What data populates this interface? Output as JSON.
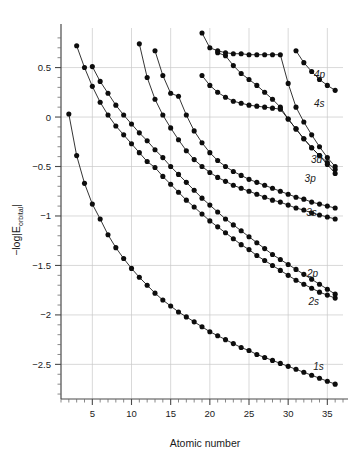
{
  "chart_data": {
    "type": "line",
    "title": "",
    "xlabel": "Atomic number",
    "ylabel": "−log|E₀ᵣᵇᵢₜₐₗ|",
    "ylabel_parts": {
      "prefix": "−log|E",
      "subscript": "orbital",
      "suffix": "|"
    },
    "xlim": [
      1,
      37
    ],
    "ylim": [
      -2.85,
      0.9
    ],
    "xticks": [
      5,
      10,
      15,
      20,
      25,
      30,
      35
    ],
    "xtick_labels": [
      "5",
      "10",
      "15",
      "20",
      "25",
      "30",
      "35"
    ],
    "xminor_step": 1,
    "yticks": [
      0.5,
      0,
      -0.5,
      -1,
      -1.5,
      -2,
      -2.5
    ],
    "ytick_labels": [
      "0.5",
      "0",
      "−0.5",
      "−1",
      "−1.5",
      "−2",
      "−2.5"
    ],
    "yminor_step": 0.1,
    "grid": "both-major",
    "legend_position": "inline-right-of-curve-ends",
    "marker": "filled-circle",
    "series": [
      {
        "name": "1s",
        "label": "1s",
        "label_at": {
          "x": 33.2,
          "y": -2.52
        },
        "x": [
          2,
          3,
          4,
          5,
          6,
          7,
          8,
          9,
          10,
          11,
          12,
          13,
          14,
          15,
          16,
          17,
          18,
          19,
          20,
          21,
          22,
          23,
          24,
          25,
          26,
          27,
          28,
          29,
          30,
          31,
          32,
          33,
          34,
          35,
          36
        ],
        "y": [
          0.03,
          -0.39,
          -0.67,
          -0.88,
          -1.03,
          -1.19,
          -1.32,
          -1.43,
          -1.53,
          -1.62,
          -1.7,
          -1.78,
          -1.85,
          -1.91,
          -1.97,
          -2.02,
          -2.07,
          -2.12,
          -2.17,
          -2.21,
          -2.25,
          -2.29,
          -2.33,
          -2.36,
          -2.4,
          -2.43,
          -2.46,
          -2.49,
          -2.52,
          -2.55,
          -2.58,
          -2.61,
          -2.64,
          -2.67,
          -2.7
        ]
      },
      {
        "name": "2s",
        "label": "2s",
        "label_at": {
          "x": 32.6,
          "y": -1.86
        },
        "x": [
          3,
          4,
          5,
          6,
          7,
          8,
          9,
          10,
          11,
          12,
          13,
          14,
          15,
          16,
          17,
          18,
          19,
          20,
          21,
          22,
          23,
          24,
          25,
          26,
          27,
          28,
          29,
          30,
          31,
          32,
          33,
          34,
          35,
          36
        ],
        "y": [
          0.72,
          0.5,
          0.31,
          0.15,
          0.02,
          -0.09,
          -0.18,
          -0.27,
          -0.36,
          -0.45,
          -0.51,
          -0.6,
          -0.68,
          -0.76,
          -0.84,
          -0.91,
          -0.98,
          -1.05,
          -1.11,
          -1.17,
          -1.23,
          -1.29,
          -1.34,
          -1.4,
          -1.45,
          -1.5,
          -1.55,
          -1.6,
          -1.65,
          -1.69,
          -1.73,
          -1.77,
          -1.8,
          -1.83
        ]
      },
      {
        "name": "2p",
        "label": "2p",
        "label_at": {
          "x": 32.4,
          "y": -1.58
        },
        "x": [
          5,
          6,
          7,
          8,
          9,
          10,
          11,
          12,
          13,
          14,
          15,
          16,
          17,
          18,
          19,
          20,
          21,
          22,
          23,
          24,
          25,
          26,
          27,
          28,
          29,
          30,
          31,
          32,
          33,
          34,
          35,
          36
        ],
        "y": [
          0.51,
          0.36,
          0.24,
          0.12,
          0.02,
          -0.07,
          -0.16,
          -0.24,
          -0.33,
          -0.41,
          -0.5,
          -0.58,
          -0.66,
          -0.74,
          -0.82,
          -0.89,
          -0.96,
          -1.03,
          -1.09,
          -1.15,
          -1.21,
          -1.27,
          -1.33,
          -1.39,
          -1.44,
          -1.49,
          -1.54,
          -1.59,
          -1.64,
          -1.69,
          -1.74,
          -1.79
        ]
      },
      {
        "name": "3s",
        "label": "3s",
        "label_at": {
          "x": 32.3,
          "y": -0.96
        },
        "x": [
          11,
          12,
          13,
          14,
          15,
          16,
          17,
          18,
          19,
          20,
          21,
          22,
          23,
          24,
          25,
          26,
          27,
          28,
          29,
          30,
          31,
          32,
          33,
          34,
          35,
          36
        ],
        "y": [
          0.74,
          0.4,
          0.18,
          0.02,
          -0.11,
          -0.23,
          -0.34,
          -0.43,
          -0.5,
          -0.56,
          -0.61,
          -0.65,
          -0.69,
          -0.72,
          -0.75,
          -0.78,
          -0.81,
          -0.84,
          -0.86,
          -0.89,
          -0.92,
          -0.94,
          -0.97,
          -0.99,
          -1.01,
          -1.03
        ]
      },
      {
        "name": "3p",
        "label": "3p",
        "label_at": {
          "x": 32.1,
          "y": -0.62
        },
        "x": [
          13,
          14,
          15,
          16,
          17,
          18,
          19,
          20,
          21,
          22,
          23,
          24,
          25,
          26,
          27,
          28,
          29,
          30,
          31,
          32,
          33,
          34,
          35,
          36
        ],
        "y": [
          0.67,
          0.42,
          0.24,
          0.21,
          0.02,
          -0.14,
          -0.26,
          -0.36,
          -0.44,
          -0.5,
          -0.55,
          -0.59,
          -0.63,
          -0.66,
          -0.69,
          -0.72,
          -0.75,
          -0.78,
          -0.81,
          -0.83,
          -0.86,
          -0.88,
          -0.9,
          -0.92
        ]
      },
      {
        "name": "3d",
        "label": "3d",
        "label_at": {
          "x": 32.9,
          "y": -0.43
        },
        "x": [
          21,
          22,
          23,
          24,
          25,
          26,
          27,
          28,
          29,
          30,
          31,
          32,
          33,
          34,
          35,
          36
        ],
        "y": [
          0.65,
          0.62,
          0.52,
          0.44,
          0.38,
          0.32,
          0.25,
          0.18,
          0.1,
          -0.02,
          -0.12,
          -0.22,
          -0.31,
          -0.39,
          -0.48,
          -0.57
        ]
      },
      {
        "name": "4s",
        "label": "4s",
        "label_at": {
          "x": 33.3,
          "y": 0.14
        },
        "x": [
          19,
          20,
          21,
          22,
          23,
          24,
          25,
          26,
          27,
          28,
          29,
          30,
          31,
          32,
          33,
          34,
          35,
          36
        ],
        "y": [
          0.42,
          0.32,
          0.25,
          0.2,
          0.16,
          0.14,
          0.12,
          0.11,
          0.1,
          0.09,
          0.08,
          -0.02,
          -0.12,
          -0.22,
          -0.31,
          -0.39,
          -0.46,
          -0.53
        ]
      },
      {
        "name": "4p",
        "label": "4p",
        "label_at": {
          "x": 33.3,
          "y": 0.43
        },
        "x": [
          31,
          32,
          33,
          34,
          35,
          36
        ],
        "y": [
          0.67,
          0.55,
          0.46,
          0.38,
          0.32,
          0.27
        ]
      },
      {
        "name": "4s-upper",
        "label": "",
        "label_at": {
          "x": 0,
          "y": 0
        },
        "x": [
          19,
          20,
          21,
          22,
          23,
          24,
          25,
          26,
          27,
          28,
          29,
          30,
          31,
          32,
          33,
          34,
          35,
          36
        ],
        "y": [
          0.85,
          0.7,
          0.67,
          0.65,
          0.64,
          0.64,
          0.63,
          0.63,
          0.63,
          0.63,
          0.63,
          0.34,
          0.1,
          -0.05,
          -0.18,
          -0.3,
          -0.41,
          -0.5
        ]
      }
    ]
  },
  "annotations": {
    "series_labels": [
      "4p",
      "4s",
      "3d",
      "3p",
      "3s",
      "2p",
      "2s",
      "1s"
    ]
  },
  "colors": {
    "marker": "#0d0d0d",
    "line": "#111111",
    "grid": "#c9c9c9",
    "axis": "#4a4a4a",
    "text": "#1a1a1a",
    "background": "#ffffff"
  }
}
